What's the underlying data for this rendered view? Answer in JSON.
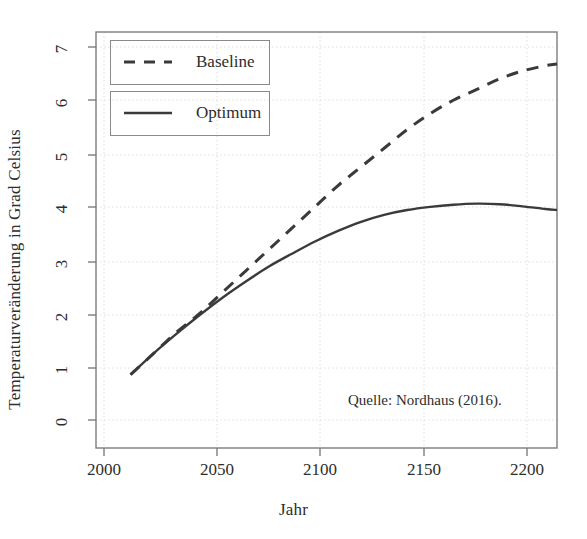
{
  "chart_data": {
    "type": "line",
    "title": "",
    "subtitle": "",
    "xlabel": "Jahr",
    "ylabel": "Temperaturveränderung in Grad Celsius",
    "xlim": [
      2000,
      2200
    ],
    "ylim": [
      0,
      7
    ],
    "xticks": [
      2000,
      2050,
      2100,
      2150,
      2200
    ],
    "xtick_labels": [
      "2000",
      "2050",
      "2100",
      "2150",
      "2200"
    ],
    "yticks": [
      0,
      1,
      2,
      3,
      4,
      5,
      6,
      7
    ],
    "ytick_labels": [
      "0",
      "1",
      "2",
      "3",
      "4",
      "5",
      "6",
      "7"
    ],
    "grid": true,
    "grid_style": "dotted",
    "legend_position": "top-left",
    "annotations": [
      {
        "name": "source-note",
        "text": "Quelle: Nordhaus (2016).",
        "x": 2140,
        "y": 0.55
      }
    ],
    "x": [
      2015,
      2025,
      2035,
      2045,
      2055,
      2065,
      2075,
      2085,
      2095,
      2105,
      2115,
      2125,
      2135,
      2145,
      2155,
      2165,
      2175,
      2185,
      2195,
      2200
    ],
    "series": [
      {
        "name": "Baseline",
        "label": "Baseline",
        "linestyle": "dashed",
        "color": "#3a3a3a",
        "values": [
          0.85,
          1.25,
          1.65,
          2.0,
          2.4,
          2.8,
          3.2,
          3.6,
          4.0,
          4.4,
          4.75,
          5.1,
          5.45,
          5.75,
          6.0,
          6.2,
          6.4,
          6.55,
          6.65,
          6.68
        ]
      },
      {
        "name": "Optimum",
        "label": "Optimum",
        "linestyle": "solid",
        "color": "#3a3a3a",
        "values": [
          0.85,
          1.25,
          1.62,
          1.97,
          2.3,
          2.6,
          2.88,
          3.12,
          3.35,
          3.55,
          3.72,
          3.85,
          3.94,
          4.0,
          4.04,
          4.06,
          4.05,
          4.01,
          3.96,
          3.94
        ]
      }
    ]
  },
  "legend": {
    "entries": [
      {
        "label": "Baseline",
        "style": "dashed"
      },
      {
        "label": "Optimum",
        "style": "solid"
      }
    ]
  },
  "colors": {
    "line": "#3a3a3a",
    "axis": "#6f6f6f",
    "grid": "#d9d9d9",
    "text": "#2d2d2d",
    "background": "#ffffff"
  }
}
